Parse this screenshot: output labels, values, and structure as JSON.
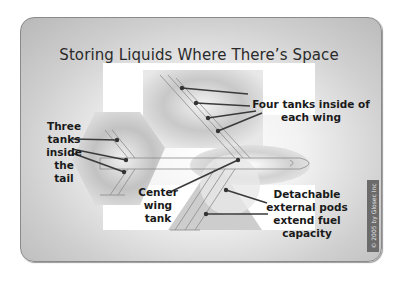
{
  "diagram": {
    "title": "Storing Liquids Where There’s Space",
    "labels": {
      "wing_tanks": [
        "Four tanks inside of",
        "each wing"
      ],
      "tail_tanks": [
        "Three",
        "tanks",
        "inside",
        "the tail"
      ],
      "center_tank": [
        "Center",
        "wing",
        "tank"
      ],
      "external_pods": [
        "Detachable",
        "external pods",
        "extend fuel",
        "capacity"
      ]
    },
    "copyright": "© 2005 by Glosec Inc",
    "colors": {
      "frame_border": "#8a8a8a",
      "leader_line": "#3a3a3a",
      "highlight_white": "#ffffff",
      "airplane_line": "#8c8c8c"
    }
  }
}
